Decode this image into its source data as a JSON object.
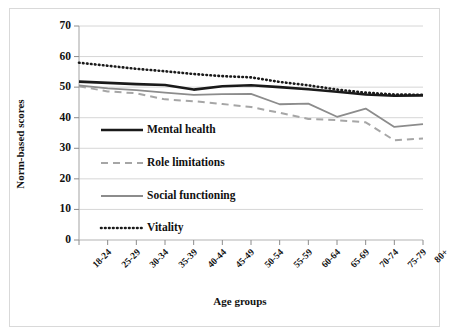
{
  "chart_data": {
    "type": "line",
    "title": "",
    "xlabel": "Age groups",
    "ylabel": "Norm-based scores",
    "categories": [
      "18-24",
      "25-29",
      "30-34",
      "35-39",
      "40-44",
      "45-49",
      "50-54",
      "55-59",
      "60-64",
      "65-69",
      "70-74",
      "75-79",
      "80+"
    ],
    "ylim": [
      0,
      70
    ],
    "yticks": [
      0,
      10,
      20,
      30,
      40,
      50,
      60,
      70
    ],
    "ytick_labels": [
      "0",
      "10",
      "20",
      "30",
      "40",
      "50",
      "60",
      "70"
    ],
    "grid": "horizontal",
    "legend_position": "inside-lower-left",
    "series": [
      {
        "name": "Mental health",
        "style": "solid-thick-black",
        "color": "#1a1a1a",
        "values": [
          51.8,
          51.4,
          51.0,
          50.7,
          49.2,
          50.3,
          50.6,
          50.0,
          49.3,
          48.5,
          47.6,
          47.2,
          47.3
        ]
      },
      {
        "name": "Role limitations",
        "style": "dashed-gray",
        "color": "#a6a6a6",
        "values": [
          50.3,
          48.6,
          48.0,
          46.0,
          45.4,
          44.5,
          43.5,
          41.6,
          39.6,
          39.2,
          38.5,
          32.6,
          33.2
        ]
      },
      {
        "name": "Social functioning",
        "style": "solid-thin-gray",
        "color": "#8c8c8c",
        "values": [
          50.6,
          49.6,
          49.0,
          48.2,
          47.5,
          47.7,
          47.8,
          44.4,
          44.6,
          40.3,
          43.0,
          37.0,
          37.9
        ]
      },
      {
        "name": "Vitality",
        "style": "dotted-black",
        "color": "#1a1a1a",
        "values": [
          58.0,
          57.0,
          56.0,
          55.2,
          54.3,
          53.6,
          53.2,
          51.7,
          50.6,
          49.2,
          48.2,
          47.6,
          47.5
        ]
      }
    ]
  },
  "axes": {
    "y_title": "Norm-based scores",
    "x_title": "Age groups"
  },
  "legend": {
    "items": [
      {
        "label": "Mental health"
      },
      {
        "label": "Role limitations"
      },
      {
        "label": "Social functioning"
      },
      {
        "label": "Vitality"
      }
    ]
  }
}
